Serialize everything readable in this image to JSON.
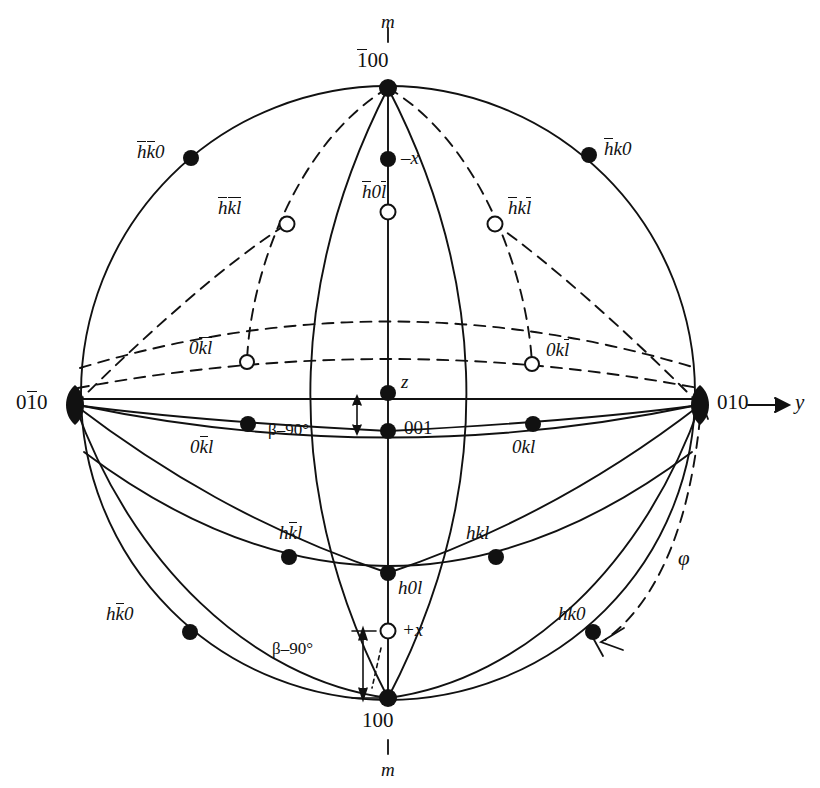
{
  "figure": {
    "type": "stereographic-projection",
    "system": "monoclinic",
    "geometry": {
      "center_x": 388,
      "center_y": 393,
      "radius": 307,
      "z_point_y": 393,
      "pole001_y": 431,
      "minus_x_y": 159,
      "plus_x_y": 631
    },
    "colors": {
      "ink": "#111111",
      "paper": "#ffffff"
    }
  },
  "axes": {
    "y_axis_label": "y",
    "y_axis_arrow": "arrow-right-icon",
    "mirror_top": "m",
    "mirror_bottom": "m"
  },
  "poles": [
    {
      "id": "top",
      "label_parts": [
        {
          "t": "1",
          "bar": true
        },
        {
          "t": "00",
          "bar": false
        }
      ],
      "text": "100",
      "marker": "filled-lens",
      "x": 388,
      "y": 88
    },
    {
      "id": "bottom",
      "label_parts": [
        {
          "t": "100",
          "bar": false
        }
      ],
      "text": "100",
      "marker": "filled-lens",
      "x": 388,
      "y": 698
    },
    {
      "id": "left",
      "label_parts": [
        {
          "t": "0",
          "bar": false
        },
        {
          "t": "1",
          "bar": true
        },
        {
          "t": "0",
          "bar": false
        }
      ],
      "text": "010",
      "marker": "filled-lens",
      "x": 75,
      "y": 405
    },
    {
      "id": "right",
      "label_parts": [
        {
          "t": "010",
          "bar": false
        }
      ],
      "text": "010",
      "marker": "filled-lens",
      "x": 700,
      "y": 405
    }
  ],
  "points": [
    {
      "name": "hk0-upper-left",
      "label": "hk0",
      "bars": "hk",
      "filled": true,
      "x": 191,
      "y": 158,
      "lx": 140,
      "ly": 144
    },
    {
      "name": "hk0-upper-right",
      "label": "hk0",
      "bars": "h",
      "filled": true,
      "x": 589,
      "y": 155,
      "lx": 604,
      "ly": 140
    },
    {
      "name": "hk0-lower-left",
      "label": "hk0",
      "bars": "k",
      "filled": true,
      "x": 190,
      "y": 632,
      "lx": 110,
      "ly": 604
    },
    {
      "name": "hk0-lower-right",
      "label": "hk0",
      "bars": "",
      "filled": true,
      "x": 593,
      "y": 632,
      "lx": 564,
      "ly": 604
    },
    {
      "name": "minus-x",
      "label": "-x",
      "bars": "",
      "filled": true,
      "x": 388,
      "y": 159,
      "lx": 404,
      "ly": 148
    },
    {
      "name": "plus-x",
      "label": "+x",
      "bars": "",
      "filled": false,
      "x": 388,
      "y": 631,
      "lx": 404,
      "ly": 620
    },
    {
      "name": "h0l-upper",
      "label": "h0l",
      "bars": "hl",
      "filled": false,
      "x": 388,
      "y": 212,
      "lx": 366,
      "ly": 184
    },
    {
      "name": "h0l-lower",
      "label": "h0l",
      "bars": "",
      "filled": true,
      "x": 388,
      "y": 573,
      "lx": 398,
      "ly": 582
    },
    {
      "name": "hkl-upper-left",
      "label": "hkl",
      "bars": "hkl",
      "filled": false,
      "x": 287,
      "y": 224,
      "lx": 225,
      "ly": 200
    },
    {
      "name": "hkl-upper-right",
      "label": "hkl",
      "bars": "hl",
      "filled": false,
      "x": 495,
      "y": 224,
      "lx": 510,
      "ly": 200
    },
    {
      "name": "hkl-lower-left",
      "label": "hkl",
      "bars": "k",
      "filled": true,
      "x": 289,
      "y": 557,
      "lx": 290,
      "ly": 525
    },
    {
      "name": "hkl-lower-right",
      "label": "hkl",
      "bars": "",
      "filled": true,
      "x": 496,
      "y": 557,
      "lx": 468,
      "ly": 525
    },
    {
      "name": "0kl-upper-left",
      "label": "0kl",
      "bars": "kl",
      "filled": false,
      "x": 247,
      "y": 362,
      "lx": 194,
      "ly": 341
    },
    {
      "name": "0kl-upper-right",
      "label": "0kl",
      "bars": "l",
      "filled": false,
      "x": 532,
      "y": 364,
      "lx": 546,
      "ly": 341
    },
    {
      "name": "0kl-lower-left",
      "label": "0kl",
      "bars": "k",
      "filled": true,
      "x": 248,
      "y": 424,
      "lx": 196,
      "ly": 437
    },
    {
      "name": "0kl-lower-right",
      "label": "0kl",
      "bars": "",
      "filled": true,
      "x": 533,
      "y": 424,
      "lx": 517,
      "ly": 437
    },
    {
      "name": "z-point",
      "label": "z",
      "bars": "",
      "filled": true,
      "x": 388,
      "y": 393,
      "lx": 401,
      "ly": 375
    },
    {
      "name": "001-point",
      "label": "001",
      "bars": "",
      "filled": true,
      "x": 388,
      "y": 431,
      "lx": 404,
      "ly": 419
    }
  ],
  "annotations": {
    "beta_top": "β–90°",
    "beta_bottom": "β–90°",
    "phi": "φ",
    "z_label": "z",
    "index_001": "001",
    "index_100_bottom": "100"
  }
}
